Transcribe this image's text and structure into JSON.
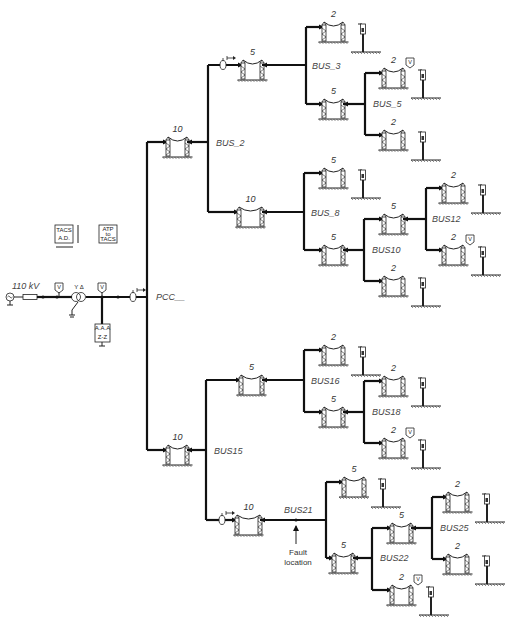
{
  "diagram": {
    "source": {
      "voltage_label": "110 kV"
    },
    "pcc_label": "PCC__",
    "tacs_boxes": [
      {
        "id": "tacs-ad",
        "lines": [
          "TACS",
          "A.D."
        ]
      },
      {
        "id": "atp-to-tacs",
        "lines": [
          "ATP",
          "to",
          "TACS"
        ]
      }
    ],
    "zz_transformer": {
      "top": "A.A.A",
      "label": "Z-Z"
    },
    "transformer_label": "Y Δ",
    "meter_glyph": "V",
    "current_probe_glyph": "I→",
    "fault": {
      "line1": "Fault",
      "line2": "location"
    },
    "buses": {
      "bus_2": "BUS_2",
      "bus_3": "BUS_3",
      "bus_5": "BUS_5",
      "bus_8": "BUS_8",
      "bus10": "BUS10",
      "bus12": "BUS12",
      "bus15": "BUS15",
      "bus16": "BUS16",
      "bus18": "BUS18",
      "bus21": "BUS21",
      "bus22": "BUS22",
      "bus25": "BUS25"
    },
    "lines": [
      {
        "id": "L-pcc-bus2",
        "length": "10"
      },
      {
        "id": "L-bus2-bus3",
        "length": "5"
      },
      {
        "id": "L-bus3-load1",
        "length": "2"
      },
      {
        "id": "L-bus3-bus5",
        "length": "5"
      },
      {
        "id": "L-bus5-load1",
        "length": "2"
      },
      {
        "id": "L-bus5-load2",
        "length": "2"
      },
      {
        "id": "L-bus2-bus8",
        "length": "10"
      },
      {
        "id": "L-bus8-load1",
        "length": "5"
      },
      {
        "id": "L-bus8-bus10",
        "length": "5"
      },
      {
        "id": "L-bus10-bus12",
        "length": "5"
      },
      {
        "id": "L-bus10-load1",
        "length": "2"
      },
      {
        "id": "L-bus12-load1",
        "length": "2"
      },
      {
        "id": "L-bus12-load2",
        "length": "2"
      },
      {
        "id": "L-pcc-bus15",
        "length": "10"
      },
      {
        "id": "L-bus15-bus16",
        "length": "5"
      },
      {
        "id": "L-bus16-load1",
        "length": "2"
      },
      {
        "id": "L-bus16-bus18",
        "length": "5"
      },
      {
        "id": "L-bus18-load1",
        "length": "2"
      },
      {
        "id": "L-bus18-load2",
        "length": "2"
      },
      {
        "id": "L-bus15-bus21",
        "length": "10"
      },
      {
        "id": "L-bus21-load1",
        "length": "5"
      },
      {
        "id": "L-bus21-bus22",
        "length": "5"
      },
      {
        "id": "L-bus22-bus25",
        "length": "5"
      },
      {
        "id": "L-bus22-load1",
        "length": "2"
      },
      {
        "id": "L-bus25-load1",
        "length": "2"
      },
      {
        "id": "L-bus25-load2",
        "length": "2"
      }
    ]
  }
}
